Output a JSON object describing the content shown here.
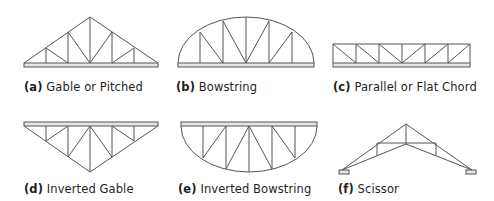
{
  "figures": [
    {
      "id": "a",
      "letter": "(a)",
      "name": "Gable or Pitched"
    },
    {
      "id": "b",
      "letter": "(b)",
      "name": "Bowstring"
    },
    {
      "id": "c",
      "letter": "(c)",
      "name": "Parallel or Flat Chord"
    },
    {
      "id": "d",
      "letter": "(d)",
      "name": "Inverted Gable"
    },
    {
      "id": "e",
      "letter": "(e)",
      "name": "Inverted Bowstring"
    },
    {
      "id": "f",
      "letter": "(f)",
      "name": "Scissor"
    }
  ],
  "colors": {
    "line": "#555555",
    "chord_fill": "#e6e6e6",
    "text": "#1e1e1e"
  }
}
